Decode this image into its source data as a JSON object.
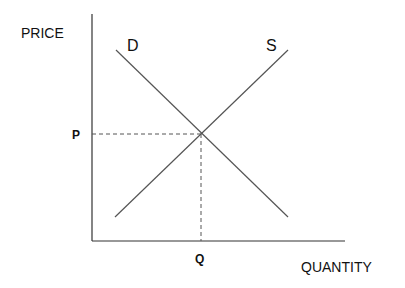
{
  "diagram": {
    "type": "supply-demand",
    "axes": {
      "y_label": "PRICE",
      "x_label": "QUANTITY",
      "origin": [
        92,
        241
      ],
      "y_top": 14,
      "x_right": 345
    },
    "curves": [
      {
        "name": "D",
        "label": "D",
        "from": [
          116,
          50
        ],
        "to": [
          288,
          217
        ]
      },
      {
        "name": "S",
        "label": "S",
        "from": [
          288,
          50
        ],
        "to": [
          115,
          217
        ]
      }
    ],
    "equilibrium": {
      "point": [
        201,
        134
      ],
      "price_label": "P",
      "quantity_label": "Q"
    },
    "colors": {
      "axis": "#333333",
      "curve": "#555555",
      "guide": "#555555",
      "text": "#111111"
    }
  }
}
